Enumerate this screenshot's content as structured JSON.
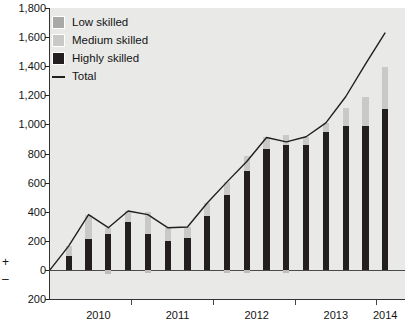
{
  "chart_data": {
    "type": "bar",
    "subtype": "stacked-bar-with-line",
    "title": "",
    "subtitle": "",
    "xlabel": "",
    "ylabel": "",
    "ylim": [
      -200,
      1800
    ],
    "ytick_values": [
      -200,
      0,
      200,
      400,
      600,
      800,
      1000,
      1200,
      1400,
      1600,
      1800
    ],
    "ytick_labels": [
      "200",
      "0",
      "200",
      "400",
      "600",
      "800",
      "1,000",
      "1,200",
      "1,400",
      "1,600",
      "1,800"
    ],
    "axis_sign_markers": [
      "+",
      "–"
    ],
    "grid": false,
    "legend_position": "top-left",
    "categories": [
      "2010Q1",
      "2010Q2",
      "2010Q3",
      "2010Q4",
      "2011Q1",
      "2011Q2",
      "2011Q3",
      "2011Q4",
      "2012Q1",
      "2012Q2",
      "2012Q3",
      "2012Q4",
      "2013Q1",
      "2013Q2",
      "2013Q3",
      "2013Q4",
      "2014Q1"
    ],
    "xtick_labels": [
      "2010",
      "2011",
      "2012",
      "2013",
      "2014"
    ],
    "xtick_positions": [
      2010,
      2011,
      2012,
      2013,
      2014
    ],
    "series": [
      {
        "name": "Highly skilled",
        "color": "#231f20",
        "values": [
          95,
          215,
          245,
          330,
          250,
          200,
          220,
          370,
          515,
          680,
          830,
          860,
          860,
          945,
          990,
          990,
          1105
        ]
      },
      {
        "name": "Medium skilled",
        "color": "#c9c9c7",
        "values": [
          70,
          165,
          45,
          75,
          150,
          90,
          75,
          90,
          90,
          100,
          80,
          65,
          55,
          65,
          120,
          200,
          290
        ]
      },
      {
        "name": "Low skilled",
        "color": "#a9a9a7",
        "values": [
          0,
          0,
          0,
          0,
          0,
          0,
          0,
          0,
          0,
          0,
          0,
          0,
          0,
          0,
          0,
          0,
          0
        ]
      },
      {
        "name": "Negative contribution",
        "color": "#bdbdbb",
        "values": [
          0,
          0,
          -25,
          0,
          -20,
          0,
          0,
          0,
          -20,
          -20,
          0,
          -20,
          0,
          0,
          0,
          0,
          0
        ]
      }
    ],
    "line_series": {
      "name": "Total",
      "color": "#231f20",
      "values": [
        0,
        165,
        380,
        290,
        405,
        380,
        290,
        295,
        460,
        605,
        745,
        910,
        880,
        915,
        1010,
        1190,
        1415,
        1630
      ]
    },
    "legend": [
      {
        "label": "Low skilled",
        "swatch": "sw-low",
        "type": "box"
      },
      {
        "label": "Medium skilled",
        "swatch": "sw-med",
        "type": "box"
      },
      {
        "label": "Highly skilled",
        "swatch": "sw-high",
        "type": "box"
      },
      {
        "label": "Total",
        "swatch": "swline",
        "type": "line"
      }
    ],
    "colors": {
      "plot_background": "#e9e9e7",
      "page_background": "#ffffff",
      "axis": "#333333",
      "text": "#141414"
    }
  }
}
